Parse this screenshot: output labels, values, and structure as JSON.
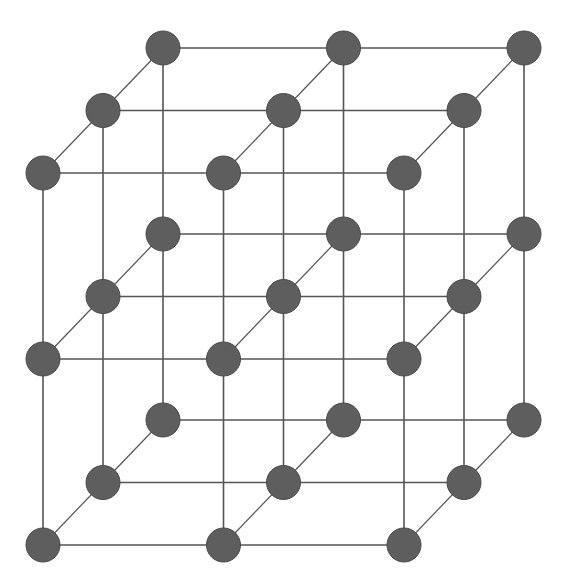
{
  "diagram": {
    "title": "",
    "type": "simple-cubic-lattice",
    "grid_size": [
      3,
      3,
      3
    ],
    "style": {
      "background": "#ffffff",
      "node_fill": "#5e5e5e",
      "node_stroke": "#4a4a4a",
      "node_radius": 17,
      "edge_color": "#555555",
      "edge_width": 1.6,
      "depth_edge_width": 1.2
    },
    "projection": {
      "origin": [
        43,
        545
      ],
      "x_step": [
        180.5,
        0
      ],
      "y_step": [
        0,
        -186
      ],
      "z_step": [
        60,
        -62.5
      ]
    },
    "node_count": 27,
    "nodes": [
      {
        "i": 0,
        "j": 0,
        "k": 0
      },
      {
        "i": 1,
        "j": 0,
        "k": 0
      },
      {
        "i": 2,
        "j": 0,
        "k": 0
      },
      {
        "i": 0,
        "j": 1,
        "k": 0
      },
      {
        "i": 1,
        "j": 1,
        "k": 0
      },
      {
        "i": 2,
        "j": 1,
        "k": 0
      },
      {
        "i": 0,
        "j": 2,
        "k": 0
      },
      {
        "i": 1,
        "j": 2,
        "k": 0
      },
      {
        "i": 2,
        "j": 2,
        "k": 0
      },
      {
        "i": 0,
        "j": 0,
        "k": 1
      },
      {
        "i": 1,
        "j": 0,
        "k": 1
      },
      {
        "i": 2,
        "j": 0,
        "k": 1
      },
      {
        "i": 0,
        "j": 1,
        "k": 1
      },
      {
        "i": 1,
        "j": 1,
        "k": 1
      },
      {
        "i": 2,
        "j": 1,
        "k": 1
      },
      {
        "i": 0,
        "j": 2,
        "k": 1
      },
      {
        "i": 1,
        "j": 2,
        "k": 1
      },
      {
        "i": 2,
        "j": 2,
        "k": 1
      },
      {
        "i": 0,
        "j": 0,
        "k": 2
      },
      {
        "i": 1,
        "j": 0,
        "k": 2
      },
      {
        "i": 2,
        "j": 0,
        "k": 2
      },
      {
        "i": 0,
        "j": 1,
        "k": 2
      },
      {
        "i": 1,
        "j": 1,
        "k": 2
      },
      {
        "i": 2,
        "j": 1,
        "k": 2
      },
      {
        "i": 0,
        "j": 2,
        "k": 2
      },
      {
        "i": 1,
        "j": 2,
        "k": 2
      },
      {
        "i": 2,
        "j": 2,
        "k": 2
      }
    ]
  }
}
